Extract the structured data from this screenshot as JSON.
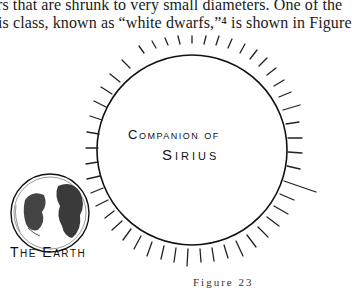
{
  "page": {
    "body_text": [
      "rs that are shrunk to very small diameters. One of the",
      "is class, known as “white dwarfs,”⁴ is shown in Figure"
    ]
  },
  "figure": {
    "labels": {
      "companion": "Companion of",
      "sirius": "Sirius",
      "earth": "The Earth"
    },
    "caption": "Figure 23"
  }
}
